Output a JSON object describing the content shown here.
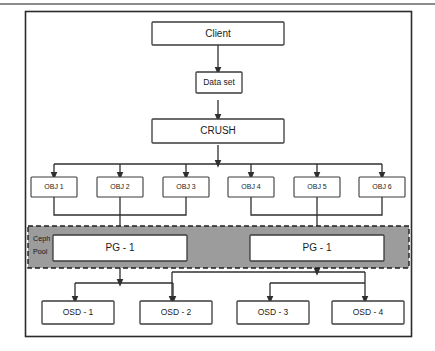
{
  "figure": {
    "name": "ceph-data-placement-diagram",
    "top_rule_color": "#8d8d8d",
    "frame_color": "#2b2b2b",
    "box_fill": "#ffffff",
    "box_stroke": "#3b3b3b",
    "connector_color": "#2f2f2f",
    "pool_fill": "#9c9c9c",
    "pool_stroke": "#1f1f1f"
  },
  "nodes": {
    "client": {
      "label": "Client"
    },
    "data_set": {
      "label": "Data set"
    },
    "crush": {
      "label": "CRUSH"
    },
    "objects": [
      {
        "label": "OBJ 1"
      },
      {
        "label": "OBJ 2"
      },
      {
        "label": "OBJ 3"
      },
      {
        "label": "OBJ 4"
      },
      {
        "label": "OBJ 5"
      },
      {
        "label": "OBJ 6"
      }
    ],
    "pool": {
      "label_line1": "Ceph",
      "label_line2": "Pool",
      "placement_groups": [
        {
          "label": "PG - 1"
        },
        {
          "label": "PG - 1"
        }
      ]
    },
    "osds": [
      {
        "label": "OSD - 1"
      },
      {
        "label": "OSD - 2"
      },
      {
        "label": "OSD - 3"
      },
      {
        "label": "OSD - 4"
      }
    ]
  }
}
